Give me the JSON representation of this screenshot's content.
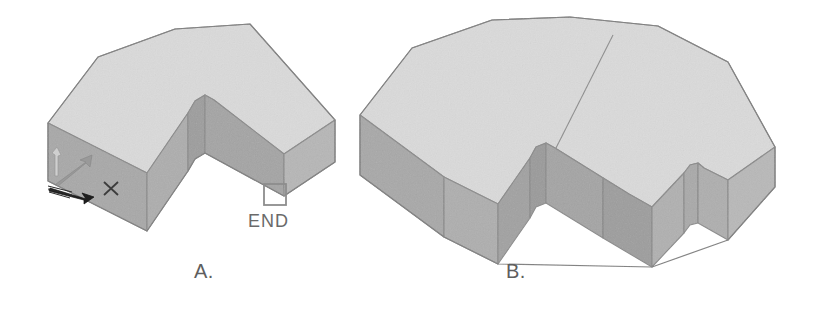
{
  "figure": {
    "background_color": "#ffffff",
    "kind": "isometric-solid-model-comparison",
    "parts": [
      {
        "id": "A",
        "caption": "A.",
        "description": "L-shaped extruded solid with chamfered corners, single solid",
        "annotations": {
          "end_marker_label": "END",
          "end_marker_icon": "square-snap-marker-icon",
          "axis_icon": "ucs-axis-triad-icon",
          "point_marker_icon": "x-point-marker-icon"
        }
      },
      {
        "id": "B",
        "caption": "B.",
        "description": "C-shaped (horseshoe) extruded solid with chamfered corners, union of two solids showing seam edge",
        "annotations": {}
      }
    ],
    "colors": {
      "top_face": "#d6d6d6",
      "top_face_light": "#dcdcdc",
      "left_face": "#a6a6a6",
      "right_face": "#b4b4b4",
      "inner_face": "#9c9c9c",
      "inner_face_dark": "#949494",
      "edge_stroke": "#8a8a8a",
      "caption_text": "#5e5e5e",
      "end_text": "#6a6a6a",
      "marker_stroke": "#8d8d8d",
      "axis_dark": "#1c1c1c"
    }
  }
}
